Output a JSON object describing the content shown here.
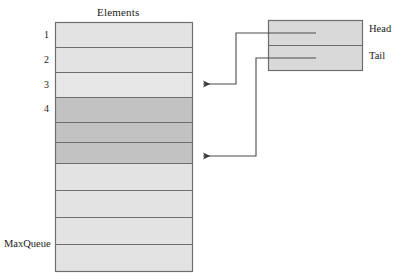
{
  "diagram": {
    "title": "Elements",
    "colors": {
      "cell_light": "#e3e3e3",
      "cell_dark": "#c2c2c2",
      "border": "#6e6e6e",
      "line": "#4a4a4a",
      "background": "#ffffff"
    },
    "elements_array": {
      "label": "Elements",
      "bottom_label": "MaxQueue",
      "row_count": 10,
      "rows": [
        {
          "index": "1",
          "label": "1",
          "shade": "light"
        },
        {
          "index": "2",
          "label": "2",
          "shade": "light"
        },
        {
          "index": "3",
          "label": "3",
          "shade": "light"
        },
        {
          "index": "4",
          "label": "4",
          "shade": "dark"
        },
        {
          "index": "5",
          "label": "",
          "shade": "dark"
        },
        {
          "index": "6",
          "label": "",
          "shade": "dark"
        },
        {
          "index": "7",
          "label": "",
          "shade": "light"
        },
        {
          "index": "8",
          "label": "",
          "shade": "light"
        },
        {
          "index": "9",
          "label": "",
          "shade": "light"
        },
        {
          "index": "10",
          "label": "",
          "shade": "light"
        }
      ]
    },
    "pointer_box": {
      "cells": [
        {
          "name": "head",
          "label": "Head"
        },
        {
          "name": "tail",
          "label": "Tail"
        }
      ]
    },
    "arrows": [
      {
        "from": "head",
        "to_row": "3",
        "direction": "left"
      },
      {
        "from": "tail",
        "to_row": "6",
        "direction": "left"
      }
    ]
  }
}
